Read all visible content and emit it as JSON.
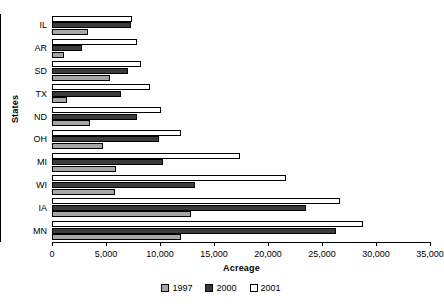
{
  "chart_data": {
    "type": "bar",
    "orientation": "horizontal",
    "title": "",
    "xlabel": "Acreage",
    "ylabel": "States",
    "categories": [
      "IL",
      "AR",
      "SD",
      "TX",
      "ND",
      "OH",
      "MI",
      "WI",
      "IA",
      "MN"
    ],
    "series": [
      {
        "name": "1997",
        "color": "#a6a6a6",
        "values": [
          3300,
          1100,
          5400,
          1400,
          3500,
          4700,
          5900,
          5800,
          12900,
          11900
        ]
      },
      {
        "name": "2000",
        "color": "#3b3b3b",
        "values": [
          7300,
          2800,
          7000,
          6400,
          7900,
          9900,
          10300,
          13200,
          23500,
          26300
        ]
      },
      {
        "name": "2001",
        "color": "#ffffff",
        "values": [
          7400,
          7900,
          8200,
          9100,
          10100,
          11900,
          17400,
          21700,
          26700,
          28800
        ]
      }
    ],
    "xlim": [
      0,
      35000
    ],
    "xticks": [
      0,
      5000,
      10000,
      15000,
      20000,
      25000,
      30000,
      35000
    ],
    "xtick_labels": [
      "0",
      "5,000",
      "10,000",
      "15,000",
      "20,000",
      "25,000",
      "30,000",
      "35,000"
    ],
    "grid": false,
    "legend_position": "bottom",
    "legend_entries": [
      "1997",
      "2000",
      "2001"
    ]
  }
}
